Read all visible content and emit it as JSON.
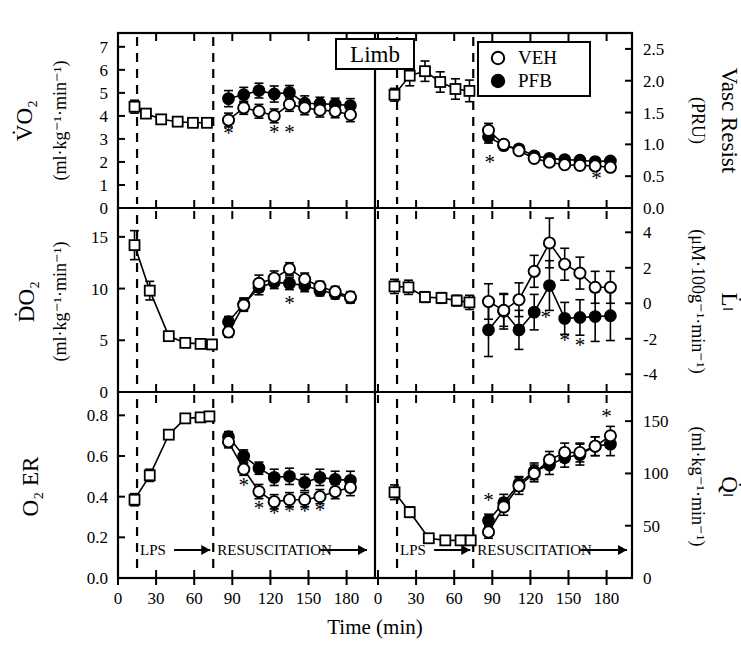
{
  "figure": {
    "title": "Limb",
    "xlabel": "Time (min)",
    "legend": [
      {
        "symbol": "open-circle",
        "label": "VEH"
      },
      {
        "symbol": "filled-circle",
        "label": "PFB"
      }
    ],
    "phase_labels": {
      "lps": "LPS",
      "resuscitation": "RESUSCITATION"
    },
    "significance_marker": "*",
    "xticks": [
      0,
      30,
      60,
      90,
      120,
      150,
      180
    ],
    "xticklabels": [
      "0",
      "30",
      "60",
      "90",
      "120",
      "150",
      "180"
    ],
    "xlim": [
      0,
      200
    ],
    "vline_lps_start": 15,
    "vline_resus_start": 75,
    "colors": {
      "veh_fill": "#ffffff",
      "pfb_fill": "#000000",
      "baseline_fill": "#ffffff",
      "line": "#000000"
    }
  },
  "chart_data": [
    {
      "panel": "top-left",
      "type": "line",
      "title": "VO2",
      "ylabel_main": "V̇O₂",
      "ylabel_units": "(ml·kg⁻¹·min⁻¹)",
      "ylabel_side": "left",
      "ylim": [
        0,
        7.6
      ],
      "yticks": [
        0,
        1,
        2,
        3,
        4,
        5,
        6,
        7
      ],
      "yticklabels": [
        "0",
        "1",
        "2",
        "3",
        "4",
        "5",
        "6",
        "7"
      ],
      "series": [
        {
          "name": "baseline",
          "symbol": "open-square",
          "x": [
            13,
            22,
            34,
            47,
            59,
            70
          ],
          "y": [
            4.4,
            4.1,
            3.85,
            3.75,
            3.7,
            3.7
          ],
          "err": [
            0.28,
            0.15,
            0.1,
            0.1,
            0.1,
            0.1
          ]
        },
        {
          "name": "PFB",
          "symbol": "filled-circle",
          "x": [
            87,
            99,
            111,
            123,
            135,
            147,
            159,
            171,
            183
          ],
          "y": [
            4.75,
            4.92,
            5.1,
            4.95,
            5.02,
            4.55,
            4.53,
            4.5,
            4.45
          ],
          "err": [
            0.35,
            0.32,
            0.32,
            0.35,
            0.3,
            0.32,
            0.28,
            0.27,
            0.3
          ]
        },
        {
          "name": "VEH",
          "symbol": "open-circle",
          "x": [
            87,
            99,
            111,
            123,
            135,
            147,
            159,
            171,
            183
          ],
          "y": [
            3.82,
            4.35,
            4.2,
            4.0,
            4.5,
            4.35,
            4.25,
            4.2,
            4.05
          ],
          "err": [
            0.3,
            0.28,
            0.3,
            0.3,
            0.3,
            0.3,
            0.3,
            0.28,
            0.3
          ]
        }
      ],
      "stars_x": [
        87,
        123,
        135
      ],
      "stars_y": [
        3.25,
        3.3,
        3.3
      ]
    },
    {
      "panel": "top-right",
      "type": "line",
      "title": "Vascular Resistance",
      "ylabel_main": "Vasc Resist",
      "ylabel_units": "(PRU)",
      "ylabel_side": "right",
      "ylim": [
        0.0,
        2.75
      ],
      "yticks": [
        0.0,
        0.5,
        1.0,
        1.5,
        2.0,
        2.5
      ],
      "yticklabels": [
        "0.0",
        "0.5",
        "1.0",
        "1.5",
        "2.0",
        "2.5"
      ],
      "series": [
        {
          "name": "baseline",
          "symbol": "open-square",
          "x": [
            13,
            25,
            37,
            49,
            61,
            72
          ],
          "y": [
            1.78,
            2.08,
            2.15,
            1.98,
            1.87,
            1.84
          ],
          "err": [
            0.1,
            0.16,
            0.16,
            0.16,
            0.16,
            0.17
          ]
        },
        {
          "name": "PFB",
          "symbol": "filled-circle",
          "x": [
            87,
            99,
            111,
            123,
            135,
            147,
            159,
            171,
            183
          ],
          "y": [
            1.12,
            0.98,
            0.93,
            0.82,
            0.78,
            0.76,
            0.75,
            0.73,
            0.74
          ],
          "err": [
            0.1,
            0.06,
            0.05,
            0.05,
            0.04,
            0.04,
            0.04,
            0.04,
            0.04
          ]
        },
        {
          "name": "VEH",
          "symbol": "open-circle",
          "x": [
            87,
            99,
            111,
            123,
            135,
            147,
            159,
            171,
            183
          ],
          "y": [
            1.22,
            1.0,
            0.9,
            0.78,
            0.72,
            0.68,
            0.67,
            0.66,
            0.64
          ],
          "err": [
            0.11,
            0.06,
            0.05,
            0.05,
            0.04,
            0.04,
            0.04,
            0.04,
            0.04
          ]
        }
      ],
      "stars_x": [
        88,
        172
      ],
      "stars_y": [
        0.72,
        0.47
      ]
    },
    {
      "panel": "middle-left",
      "type": "line",
      "title": "DO2",
      "ylabel_main": "ḊO₂",
      "ylabel_units": "(ml·kg⁻¹·min⁻¹)",
      "ylabel_side": "left",
      "ylim": [
        0,
        17.5
      ],
      "yticks": [
        0,
        5,
        10,
        15
      ],
      "yticklabels": [
        "0",
        "5",
        "10",
        "15"
      ],
      "series": [
        {
          "name": "baseline",
          "symbol": "open-square",
          "x": [
            13,
            25,
            40,
            53,
            65,
            74
          ],
          "y": [
            14.2,
            9.8,
            5.4,
            4.75,
            4.65,
            4.6
          ],
          "err": [
            1.4,
            0.9,
            0.3,
            0.2,
            0.2,
            0.2
          ]
        },
        {
          "name": "PFB",
          "symbol": "filled-circle",
          "x": [
            87,
            99,
            111,
            123,
            135,
            147,
            159,
            171,
            183
          ],
          "y": [
            6.8,
            8.5,
            10.1,
            10.6,
            10.5,
            10.3,
            9.8,
            9.5,
            9.1
          ],
          "err": [
            0.5,
            0.6,
            0.7,
            0.6,
            0.6,
            0.6,
            0.5,
            0.5,
            0.5
          ]
        },
        {
          "name": "VEH",
          "symbol": "open-circle",
          "x": [
            87,
            99,
            111,
            123,
            135,
            147,
            159,
            171,
            183
          ],
          "y": [
            5.8,
            8.4,
            10.5,
            11.0,
            11.9,
            10.9,
            10.2,
            9.7,
            9.2
          ],
          "err": [
            0.5,
            0.6,
            0.8,
            0.7,
            0.6,
            0.6,
            0.5,
            0.5,
            0.5
          ]
        }
      ],
      "stars_x": [
        135
      ],
      "stars_y": [
        8.6
      ]
    },
    {
      "panel": "middle-right",
      "type": "line",
      "title": "Lactate flux",
      "ylabel_main": "L̇ₗ",
      "ylabel_units": "(μM·100g⁻¹·min⁻¹)",
      "ylabel_side": "right",
      "ylim": [
        -5.0,
        5.2
      ],
      "yticks": [
        -4,
        -2,
        0,
        2,
        4
      ],
      "yticklabels": [
        "-4",
        "-2",
        "0",
        "2",
        "4"
      ],
      "series": [
        {
          "name": "baseline",
          "symbol": "open-square",
          "x": [
            13,
            24,
            37,
            50,
            62,
            72
          ],
          "y": [
            0.95,
            0.9,
            0.35,
            0.3,
            0.15,
            0.05
          ],
          "err": [
            0.4,
            0.4,
            0.3,
            0.3,
            0.3,
            0.4
          ]
        },
        {
          "name": "PFB",
          "symbol": "filled-circle",
          "x": [
            87,
            99,
            111,
            123,
            135,
            147,
            159,
            171,
            183
          ],
          "y": [
            -1.5,
            -0.45,
            -1.5,
            -0.5,
            1.0,
            -0.85,
            -0.8,
            -0.75,
            -0.7
          ],
          "err": [
            1.5,
            1.0,
            1.1,
            1.0,
            1.4,
            0.9,
            1.0,
            1.4,
            1.4
          ]
        },
        {
          "name": "VEH",
          "symbol": "open-circle",
          "x": [
            87,
            99,
            111,
            123,
            135,
            147,
            159,
            171,
            183
          ],
          "y": [
            0.1,
            -0.4,
            0.2,
            1.8,
            3.4,
            2.2,
            1.7,
            0.9,
            0.9
          ],
          "err": [
            1.0,
            0.9,
            0.95,
            0.9,
            1.4,
            0.9,
            0.9,
            0.9,
            0.9
          ]
        }
      ],
      "stars_x": [
        132,
        147,
        159
      ],
      "stars_y": [
        -0.75,
        -2.05,
        -2.35
      ]
    },
    {
      "panel": "bottom-left",
      "type": "line",
      "title": "O2 Extraction Ratio",
      "ylabel_main": "O₂ ER",
      "ylabel_units": "",
      "ylabel_side": "left",
      "ylim": [
        0.0,
        0.9
      ],
      "yticks": [
        0.0,
        0.2,
        0.4,
        0.6,
        0.8
      ],
      "yticklabels": [
        "0.0",
        "0.2",
        "0.4",
        "0.6",
        "0.8"
      ],
      "series": [
        {
          "name": "baseline",
          "symbol": "open-square",
          "x": [
            13,
            25,
            40,
            53,
            65,
            72
          ],
          "y": [
            0.385,
            0.505,
            0.705,
            0.785,
            0.79,
            0.795
          ],
          "err": [
            0.03,
            0.03,
            0.02,
            0.02,
            0.02,
            0.02
          ]
        },
        {
          "name": "PFB",
          "symbol": "filled-circle",
          "x": [
            87,
            99,
            111,
            123,
            135,
            147,
            159,
            171,
            183
          ],
          "y": [
            0.695,
            0.6,
            0.54,
            0.495,
            0.5,
            0.47,
            0.495,
            0.485,
            0.48
          ],
          "err": [
            0.025,
            0.03,
            0.03,
            0.04,
            0.04,
            0.04,
            0.04,
            0.04,
            0.045
          ]
        },
        {
          "name": "VEH",
          "symbol": "open-circle",
          "x": [
            87,
            99,
            111,
            123,
            135,
            147,
            159,
            171,
            183
          ],
          "y": [
            0.67,
            0.535,
            0.425,
            0.375,
            0.385,
            0.385,
            0.4,
            0.425,
            0.445
          ],
          "err": [
            0.03,
            0.03,
            0.035,
            0.035,
            0.035,
            0.035,
            0.035,
            0.035,
            0.04
          ]
        },
        {
          "name": "extra",
          "symbol": "none",
          "x": [],
          "y": [],
          "err": []
        }
      ],
      "stars_x": [
        99,
        111,
        123,
        135,
        147,
        159
      ],
      "stars_y": [
        0.455,
        0.345,
        0.318,
        0.328,
        0.328,
        0.332
      ]
    },
    {
      "panel": "bottom-right",
      "type": "line",
      "title": "Limb blood flow",
      "ylabel_main": "Q̇ₗ",
      "ylabel_units": "(ml·kg⁻¹·min⁻¹)",
      "ylabel_side": "right",
      "ylim": [
        0,
        175
      ],
      "yticks": [
        0,
        50,
        100,
        150
      ],
      "yticklabels": [
        "0",
        "50",
        "100",
        "150"
      ],
      "series": [
        {
          "name": "baseline",
          "symbol": "open-square",
          "x": [
            13,
            25,
            40,
            53,
            65,
            73
          ],
          "y": [
            82,
            63,
            38,
            36,
            36,
            36
          ],
          "err": [
            7,
            5,
            3,
            3,
            3,
            3
          ]
        },
        {
          "name": "PFB",
          "symbol": "filled-circle",
          "x": [
            87,
            99,
            111,
            123,
            135,
            147,
            159,
            171,
            183
          ],
          "y": [
            55,
            72,
            90,
            102,
            108,
            115,
            118,
            126,
            128
          ],
          "err": [
            6,
            8,
            7,
            8,
            9,
            9,
            10,
            9,
            11
          ]
        },
        {
          "name": "VEH",
          "symbol": "open-circle",
          "x": [
            87,
            99,
            111,
            123,
            135,
            147,
            159,
            171,
            183
          ],
          "y": [
            44,
            68,
            88,
            100,
            113,
            120,
            120,
            126,
            136
          ],
          "err": [
            6,
            8,
            8,
            8,
            8,
            9,
            9,
            9,
            9
          ]
        }
      ],
      "stars_x": [
        87,
        180
      ],
      "stars_y": [
        75,
        155
      ]
    }
  ]
}
